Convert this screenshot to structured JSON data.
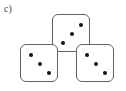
{
  "figure": {
    "part_label": "c)",
    "background_color": "#ffffff",
    "die_face_color": "#ffffff",
    "die_border_color": "#6b6255",
    "pip_color": "#141414",
    "total_pips": 9
  },
  "dice": [
    {
      "name": "top-die",
      "position": "top-center",
      "value": 3,
      "face": "three",
      "pip_arrangement": "diagonal-top-right-to-bottom-left",
      "x": 52,
      "y": 14,
      "size": 38,
      "pips": [
        {
          "cx": 28,
          "cy": 10
        },
        {
          "cx": 19,
          "cy": 19
        },
        {
          "cx": 10,
          "cy": 28
        }
      ]
    },
    {
      "name": "left-die",
      "position": "bottom-left",
      "value": 3,
      "face": "three",
      "pip_arrangement": "diagonal-top-left-to-bottom-right",
      "x": 20,
      "y": 44,
      "size": 38,
      "pips": [
        {
          "cx": 10,
          "cy": 10
        },
        {
          "cx": 19,
          "cy": 19
        },
        {
          "cx": 28,
          "cy": 28
        }
      ]
    },
    {
      "name": "right-die",
      "position": "bottom-right",
      "value": 3,
      "face": "three",
      "pip_arrangement": "diagonal-top-left-to-bottom-right",
      "x": 76,
      "y": 44,
      "size": 38,
      "pips": [
        {
          "cx": 10,
          "cy": 10
        },
        {
          "cx": 19,
          "cy": 19
        },
        {
          "cx": 28,
          "cy": 28
        }
      ]
    }
  ]
}
